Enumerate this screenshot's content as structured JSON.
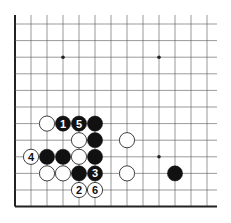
{
  "diagram": {
    "type": "go-board-fragment",
    "grid": {
      "origin_x": 15,
      "origin_y": 24,
      "col_spacing": 16,
      "row_spacing": 16.6,
      "cols": 13,
      "rows": 12,
      "left_edge": true,
      "bottom_edge": true,
      "top_open": true,
      "right_open": true
    },
    "colors": {
      "line": "#555555",
      "edge": "#222222",
      "black_stone": "#111111",
      "white_stone": "#ffffff",
      "star": "#222222"
    },
    "star_points": [
      {
        "col": 3,
        "row": 2
      },
      {
        "col": 9,
        "row": 2
      },
      {
        "col": 9,
        "row": 8
      }
    ],
    "stones": [
      {
        "col": 2,
        "row": 6,
        "color": "white",
        "label": ""
      },
      {
        "col": 3,
        "row": 6,
        "color": "black",
        "label": "1"
      },
      {
        "col": 4,
        "row": 6,
        "color": "black",
        "label": "5"
      },
      {
        "col": 5,
        "row": 6,
        "color": "black",
        "label": ""
      },
      {
        "col": 4,
        "row": 7,
        "color": "white",
        "label": ""
      },
      {
        "col": 5,
        "row": 7,
        "color": "black",
        "label": ""
      },
      {
        "col": 7,
        "row": 7,
        "color": "white",
        "label": ""
      },
      {
        "col": 1,
        "row": 8,
        "color": "white",
        "label": "4"
      },
      {
        "col": 2,
        "row": 8,
        "color": "black",
        "label": ""
      },
      {
        "col": 3,
        "row": 8,
        "color": "black",
        "label": ""
      },
      {
        "col": 4,
        "row": 8,
        "color": "white",
        "label": ""
      },
      {
        "col": 5,
        "row": 8,
        "color": "black",
        "label": ""
      },
      {
        "col": 2,
        "row": 9,
        "color": "white",
        "label": ""
      },
      {
        "col": 3,
        "row": 9,
        "color": "white",
        "label": ""
      },
      {
        "col": 4,
        "row": 9,
        "color": "black",
        "label": ""
      },
      {
        "col": 5,
        "row": 9,
        "color": "black",
        "label": "3"
      },
      {
        "col": 7,
        "row": 9,
        "color": "white",
        "label": ""
      },
      {
        "col": 10,
        "row": 9,
        "color": "black",
        "label": ""
      },
      {
        "col": 4,
        "row": 10,
        "color": "white",
        "label": "2"
      },
      {
        "col": 5,
        "row": 10,
        "color": "white",
        "label": "6"
      }
    ]
  }
}
